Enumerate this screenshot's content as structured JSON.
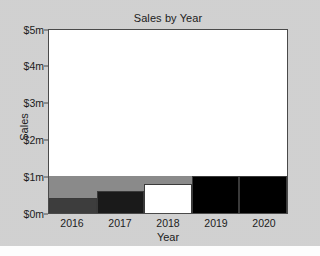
{
  "chart_data": {
    "type": "bar",
    "title": "Sales by Year",
    "xlabel": "Year",
    "ylabel": "Sales",
    "categories": [
      "2016",
      "2017",
      "2018",
      "2019",
      "2020"
    ],
    "values": [
      1,
      2,
      3,
      4,
      5
    ],
    "value_unit": "$m",
    "ytick_labels": [
      "$0m",
      "$1m",
      "$2m",
      "$3m",
      "$4m",
      "$5m"
    ],
    "ytick_values": [
      0,
      1,
      2,
      3,
      4,
      5
    ],
    "ylim": [
      0,
      5
    ],
    "grid": false,
    "legend": null,
    "bar_colors": [
      "#8a8a8a",
      "#3d3d3d",
      "#1a1a1a",
      "#ffffff",
      "#000000"
    ],
    "bar_edge_color": "#3a3a3a",
    "plot_background": "#ffffff",
    "figure_background": "#d3d3d3",
    "axis_color": "#4a4a4a",
    "text_color": "#1c1c1c"
  }
}
